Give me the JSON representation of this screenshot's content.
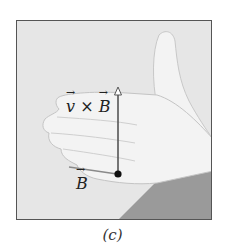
{
  "figure": {
    "caption": "(c)",
    "labels": {
      "force_direction": {
        "v": "v",
        "cross": "×",
        "b": "B"
      },
      "field": "B"
    },
    "illustration": "right-hand-rule-hand",
    "colors": {
      "frame_border": "#555555",
      "background": "#e6e6e6",
      "hand": "#f2f2f2",
      "sleeve": "#9a9a9a",
      "vector_line": "#555555",
      "field_line": "#8a8a8a",
      "origin_dot": "#111111"
    }
  }
}
